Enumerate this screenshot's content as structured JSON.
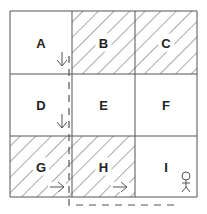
{
  "diagram": {
    "title": "",
    "grid": {
      "rows": 3,
      "cols": 3,
      "cells": [
        {
          "id": "A",
          "label": "A",
          "row": 0,
          "col": 0,
          "shaded": false,
          "marker": "arrow-down"
        },
        {
          "id": "B",
          "label": "B",
          "row": 0,
          "col": 1,
          "shaded": true,
          "marker": null
        },
        {
          "id": "C",
          "label": "C",
          "row": 0,
          "col": 2,
          "shaded": true,
          "marker": null
        },
        {
          "id": "D",
          "label": "D",
          "row": 1,
          "col": 0,
          "shaded": false,
          "marker": "arrow-down"
        },
        {
          "id": "E",
          "label": "E",
          "row": 1,
          "col": 1,
          "shaded": false,
          "marker": null
        },
        {
          "id": "F",
          "label": "F",
          "row": 1,
          "col": 2,
          "shaded": false,
          "marker": null
        },
        {
          "id": "G",
          "label": "G",
          "row": 2,
          "col": 0,
          "shaded": true,
          "marker": "arrow-right"
        },
        {
          "id": "H",
          "label": "H",
          "row": 2,
          "col": 1,
          "shaded": true,
          "marker": "arrow-right"
        },
        {
          "id": "I",
          "label": "I",
          "row": 2,
          "col": 2,
          "shaded": false,
          "marker": "person"
        }
      ]
    },
    "path": {
      "style": "dashed",
      "description": "Path from A down through D, along G/H boundary, then along bottom under H and I",
      "sequence": [
        "A",
        "D",
        "G",
        "H",
        "I"
      ]
    },
    "colors": {
      "line": "#555555",
      "hatch": "#555555",
      "background": "#ffffff",
      "text": "#222222"
    }
  }
}
